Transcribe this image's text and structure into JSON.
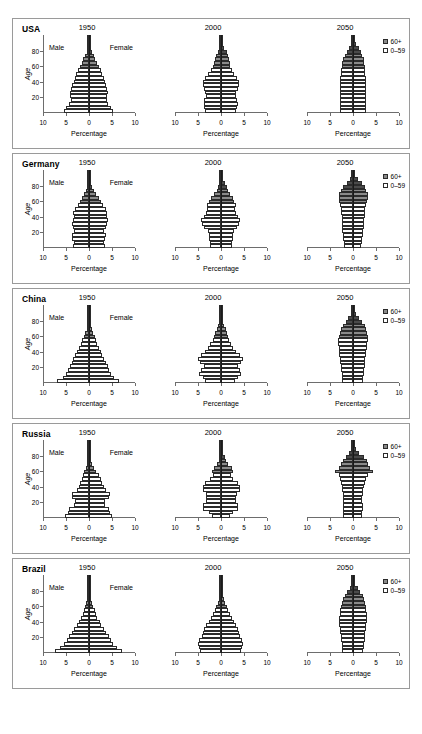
{
  "figure": {
    "axis_label_x": "Percentage",
    "axis_label_y": "Age",
    "male_label": "Male",
    "female_label": "Female",
    "x_ticks": [
      10,
      5,
      0,
      5,
      10
    ],
    "y_ticks": [
      20,
      40,
      60,
      80
    ],
    "legend": [
      {
        "label": "60+",
        "swatch": "old-swatch",
        "color": "#8a8a8a"
      },
      {
        "label": "0–59",
        "swatch": "young-swatch",
        "color": "#ffffff"
      }
    ]
  },
  "chart_data": {
    "type": "bar",
    "xlabel": "Percentage",
    "ylabel": "Age",
    "xlim": [
      -10,
      10
    ],
    "ylim": [
      0,
      100
    ],
    "grid": false,
    "legend_position": "top-right",
    "age_groups": [
      "0-4",
      "5-9",
      "10-14",
      "15-19",
      "20-24",
      "25-29",
      "30-34",
      "35-39",
      "40-44",
      "45-49",
      "50-54",
      "55-59",
      "60-64",
      "65-69",
      "70-74",
      "75-79",
      "80-84",
      "85-89",
      "90-94",
      "95-99",
      "100+"
    ],
    "old_threshold_age": 60,
    "countries": [
      "USA",
      "Germany",
      "China",
      "Russia",
      "Brazil"
    ],
    "years": [
      1950,
      2000,
      2050
    ],
    "panels": [
      {
        "country": "USA",
        "series": [
          {
            "year": 1950,
            "male": [
              5.4,
              5.0,
              4.4,
              4.0,
              4.1,
              4.1,
              3.9,
              3.6,
              3.3,
              3.1,
              2.8,
              2.4,
              2.0,
              1.6,
              1.2,
              0.8,
              0.45,
              0.2,
              0.06,
              0.01,
              0.0
            ],
            "female": [
              5.2,
              4.8,
              4.2,
              3.9,
              4.0,
              4.1,
              3.9,
              3.7,
              3.4,
              3.2,
              2.9,
              2.6,
              2.2,
              1.8,
              1.4,
              1.0,
              0.6,
              0.3,
              0.1,
              0.02,
              0.0
            ]
          },
          {
            "year": 2000,
            "male": [
              3.5,
              3.7,
              3.8,
              3.6,
              3.3,
              3.4,
              3.7,
              4.0,
              3.9,
              3.4,
              2.8,
              2.2,
              1.8,
              1.6,
              1.4,
              1.1,
              0.7,
              0.35,
              0.12,
              0.02,
              0.0
            ],
            "female": [
              3.3,
              3.5,
              3.6,
              3.4,
              3.2,
              3.3,
              3.6,
              3.9,
              3.9,
              3.5,
              2.9,
              2.4,
              2.0,
              1.9,
              1.8,
              1.6,
              1.2,
              0.7,
              0.3,
              0.07,
              0.01
            ]
          },
          {
            "year": 2050,
            "male": [
              2.9,
              2.9,
              2.9,
              2.9,
              2.9,
              2.9,
              2.9,
              2.9,
              2.9,
              2.8,
              2.7,
              2.6,
              2.5,
              2.3,
              2.1,
              1.8,
              1.4,
              0.9,
              0.45,
              0.15,
              0.03
            ],
            "female": [
              2.8,
              2.8,
              2.8,
              2.8,
              2.8,
              2.8,
              2.8,
              2.8,
              2.8,
              2.8,
              2.7,
              2.6,
              2.6,
              2.4,
              2.3,
              2.0,
              1.7,
              1.2,
              0.7,
              0.3,
              0.07
            ]
          }
        ]
      },
      {
        "country": "Germany",
        "series": [
          {
            "year": 1950,
            "male": [
              3.5,
              3.3,
              3.6,
              3.8,
              3.2,
              3.4,
              3.6,
              3.5,
              3.3,
              3.4,
              3.0,
              2.5,
              2.0,
              1.6,
              1.1,
              0.7,
              0.35,
              0.12,
              0.03,
              0.0,
              0.0
            ],
            "female": [
              3.4,
              3.2,
              3.4,
              3.6,
              3.3,
              3.6,
              4.0,
              4.1,
              3.9,
              4.0,
              3.6,
              3.1,
              2.6,
              2.1,
              1.6,
              1.1,
              0.6,
              0.25,
              0.06,
              0.01,
              0.0
            ]
          },
          {
            "year": 2000,
            "male": [
              2.4,
              2.5,
              2.7,
              2.6,
              2.9,
              3.6,
              4.2,
              4.3,
              3.7,
              3.3,
              3.0,
              3.1,
              2.6,
              2.2,
              1.5,
              0.9,
              0.6,
              0.3,
              0.09,
              0.01,
              0.0
            ],
            "female": [
              2.3,
              2.4,
              2.6,
              2.5,
              2.8,
              3.4,
              4.0,
              4.1,
              3.6,
              3.3,
              3.0,
              3.2,
              2.8,
              2.5,
              2.0,
              1.5,
              1.2,
              0.8,
              0.3,
              0.06,
              0.01
            ]
          },
          {
            "year": 2050,
            "male": [
              1.9,
              2.0,
              2.1,
              2.2,
              2.3,
              2.4,
              2.5,
              2.5,
              2.5,
              2.6,
              2.7,
              2.9,
              3.0,
              3.1,
              3.0,
              2.6,
              2.1,
              1.4,
              0.7,
              0.2,
              0.04
            ],
            "female": [
              1.8,
              1.9,
              2.0,
              2.1,
              2.2,
              2.3,
              2.4,
              2.4,
              2.5,
              2.6,
              2.7,
              2.9,
              3.1,
              3.2,
              3.2,
              2.9,
              2.5,
              1.9,
              1.1,
              0.45,
              0.1
            ]
          }
        ]
      },
      {
        "country": "China",
        "series": [
          {
            "year": 1950,
            "male": [
              6.9,
              5.6,
              5.0,
              4.6,
              4.2,
              3.8,
              3.4,
              3.0,
              2.6,
              2.2,
              1.8,
              1.5,
              1.1,
              0.8,
              0.5,
              0.3,
              0.12,
              0.04,
              0.01,
              0.0,
              0.0
            ],
            "female": [
              6.6,
              5.4,
              4.8,
              4.4,
              4.1,
              3.7,
              3.3,
              2.9,
              2.5,
              2.2,
              1.8,
              1.5,
              1.2,
              0.9,
              0.6,
              0.35,
              0.15,
              0.05,
              0.01,
              0.0,
              0.0
            ]
          },
          {
            "year": 2000,
            "male": [
              3.4,
              4.0,
              4.8,
              4.4,
              3.8,
              4.6,
              5.0,
              4.4,
              3.5,
              2.8,
              2.3,
              1.8,
              1.5,
              1.2,
              0.9,
              0.6,
              0.3,
              0.1,
              0.02,
              0.0,
              0.0
            ],
            "female": [
              3.0,
              3.6,
              4.4,
              4.1,
              3.6,
              4.4,
              4.7,
              4.2,
              3.3,
              2.7,
              2.2,
              1.8,
              1.5,
              1.3,
              1.0,
              0.7,
              0.4,
              0.15,
              0.04,
              0.01,
              0.0
            ]
          },
          {
            "year": 2050,
            "male": [
              2.3,
              2.4,
              2.5,
              2.6,
              2.7,
              2.8,
              2.9,
              3.0,
              3.0,
              3.1,
              3.2,
              3.2,
              3.1,
              2.9,
              2.6,
              2.2,
              1.6,
              1.0,
              0.45,
              0.12,
              0.02
            ],
            "female": [
              2.1,
              2.2,
              2.3,
              2.4,
              2.5,
              2.6,
              2.7,
              2.8,
              2.9,
              3.0,
              3.1,
              3.2,
              3.2,
              3.1,
              2.9,
              2.5,
              2.0,
              1.4,
              0.7,
              0.25,
              0.05
            ]
          }
        ]
      },
      {
        "country": "Russia",
        "series": [
          {
            "year": 1950,
            "male": [
              5.2,
              4.6,
              4.4,
              3.3,
              3.0,
              3.6,
              3.6,
              2.6,
              2.2,
              1.9,
              1.6,
              1.3,
              1.0,
              0.7,
              0.4,
              0.2,
              0.08,
              0.02,
              0.0,
              0.0,
              0.0
            ],
            "female": [
              5.0,
              4.5,
              4.3,
              3.4,
              3.5,
              4.4,
              4.6,
              3.6,
              3.2,
              2.9,
              2.5,
              2.1,
              1.6,
              1.1,
              0.7,
              0.4,
              0.15,
              0.04,
              0.01,
              0.0,
              0.0
            ]
          },
          {
            "year": 2000,
            "male": [
              2.0,
              2.7,
              3.9,
              3.9,
              3.3,
              3.2,
              3.3,
              3.9,
              3.9,
              3.4,
              2.3,
              1.7,
              1.9,
              1.6,
              0.9,
              0.5,
              0.35,
              0.12,
              0.02,
              0.0,
              0.0
            ],
            "female": [
              1.9,
              2.6,
              3.7,
              3.8,
              3.3,
              3.2,
              3.4,
              4.1,
              4.2,
              3.8,
              2.7,
              2.1,
              2.5,
              2.4,
              1.6,
              1.0,
              0.9,
              0.4,
              0.08,
              0.01,
              0.0
            ]
          },
          {
            "year": 2050,
            "male": [
              2.1,
              2.1,
              2.2,
              2.2,
              2.1,
              2.1,
              2.2,
              2.3,
              2.4,
              2.6,
              2.8,
              3.0,
              3.9,
              3.0,
              2.6,
              2.2,
              1.5,
              0.8,
              0.3,
              0.07,
              0.01
            ],
            "female": [
              2.0,
              2.0,
              2.1,
              2.1,
              2.0,
              2.0,
              2.1,
              2.2,
              2.4,
              2.6,
              2.9,
              3.2,
              4.4,
              3.6,
              3.3,
              3.0,
              2.3,
              1.4,
              0.6,
              0.18,
              0.03
            ]
          }
        ]
      },
      {
        "country": "Brazil",
        "series": [
          {
            "year": 1950,
            "male": [
              7.3,
              6.2,
              5.4,
              4.8,
              4.3,
              3.8,
              3.2,
              2.7,
              2.2,
              1.8,
              1.4,
              1.1,
              0.8,
              0.55,
              0.33,
              0.18,
              0.07,
              0.02,
              0.0,
              0.0,
              0.0
            ],
            "female": [
              7.1,
              6.0,
              5.3,
              4.8,
              4.3,
              3.8,
              3.2,
              2.7,
              2.3,
              1.8,
              1.5,
              1.2,
              0.9,
              0.6,
              0.38,
              0.21,
              0.09,
              0.03,
              0.01,
              0.0,
              0.0
            ]
          },
          {
            "year": 2000,
            "male": [
              4.6,
              4.8,
              5.0,
              4.7,
              4.2,
              3.9,
              3.6,
              3.2,
              2.7,
              2.2,
              1.7,
              1.3,
              1.0,
              0.75,
              0.5,
              0.3,
              0.15,
              0.05,
              0.01,
              0.0,
              0.0
            ],
            "female": [
              4.4,
              4.6,
              4.8,
              4.6,
              4.2,
              3.9,
              3.7,
              3.3,
              2.8,
              2.3,
              1.9,
              1.5,
              1.2,
              0.9,
              0.65,
              0.42,
              0.23,
              0.09,
              0.02,
              0.0,
              0.0
            ]
          },
          {
            "year": 2050,
            "male": [
              2.3,
              2.4,
              2.5,
              2.6,
              2.7,
              2.8,
              2.9,
              3.0,
              3.0,
              3.0,
              2.9,
              2.8,
              2.6,
              2.4,
              2.1,
              1.7,
              1.2,
              0.7,
              0.3,
              0.08,
              0.01
            ],
            "female": [
              2.2,
              2.3,
              2.4,
              2.5,
              2.6,
              2.7,
              2.8,
              2.9,
              3.0,
              3.0,
              3.0,
              2.9,
              2.8,
              2.6,
              2.4,
              2.1,
              1.6,
              1.0,
              0.5,
              0.16,
              0.03
            ]
          }
        ]
      }
    ]
  }
}
